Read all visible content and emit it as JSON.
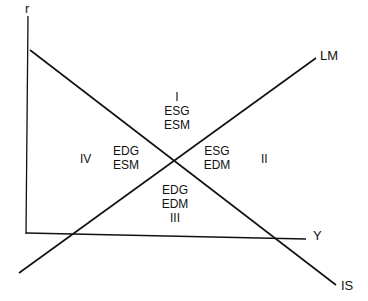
{
  "diagram": {
    "axes": {
      "vertical": "r",
      "horizontal": "Y"
    },
    "curves": {
      "is": "IS",
      "lm": "LM"
    },
    "regions": {
      "I": {
        "numeral": "I",
        "line1": "ESG",
        "line2": "ESM"
      },
      "II": {
        "numeral": "II",
        "line1": "ESG",
        "line2": "EDM"
      },
      "III": {
        "numeral": "III",
        "line1": "EDG",
        "line2": "EDM"
      },
      "IV": {
        "numeral": "IV",
        "line1": "EDG",
        "line2": "ESM"
      }
    },
    "colors": {
      "line": "#111111",
      "background": "#ffffff"
    }
  }
}
